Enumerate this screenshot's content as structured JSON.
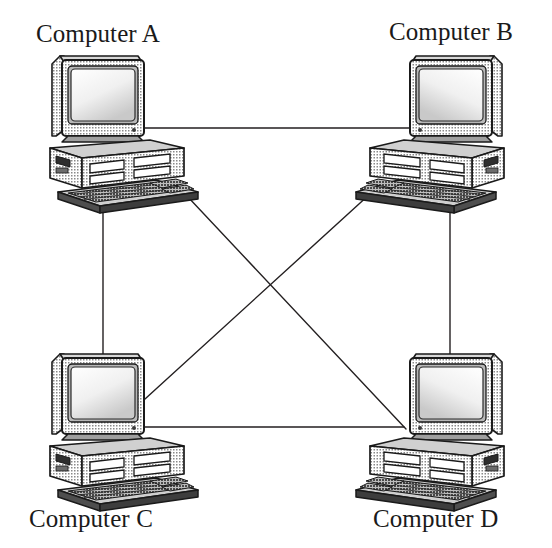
{
  "diagram": {
    "background_color": "#ffffff",
    "line_color": "#231f20",
    "line_width": 1.4,
    "width": 552,
    "height": 548
  },
  "nodes": [
    {
      "id": "A",
      "label": "Computer A",
      "icon": "desktop-computer-icon",
      "label_x": 36,
      "label_y": 20,
      "mirrored": false,
      "cx": 115,
      "cy": 130
    },
    {
      "id": "B",
      "label": "Computer B",
      "icon": "desktop-computer-icon",
      "label_x": 389,
      "label_y": 18,
      "mirrored": true,
      "cx": 440,
      "cy": 130
    },
    {
      "id": "C",
      "label": "Computer C",
      "icon": "desktop-computer-icon",
      "label_x": 29,
      "label_y": 505,
      "mirrored": false,
      "cx": 115,
      "cy": 428
    },
    {
      "id": "D",
      "label": "Computer D",
      "icon": "desktop-computer-icon",
      "label_x": 373,
      "label_y": 505,
      "mirrored": true,
      "cx": 440,
      "cy": 428
    }
  ],
  "links": [
    {
      "id": "link-a-b",
      "from": "A",
      "to": "B",
      "kind": "horizontal-top",
      "x1": 144,
      "y1": 128,
      "x2": 410,
      "y2": 128
    },
    {
      "id": "link-c-d",
      "from": "C",
      "to": "D",
      "kind": "horizontal-bottom",
      "x1": 141,
      "y1": 427,
      "x2": 404,
      "y2": 427
    },
    {
      "id": "link-a-c",
      "from": "A",
      "to": "C",
      "kind": "vertical-left",
      "x1": 103,
      "y1": 192,
      "x2": 103,
      "y2": 358
    },
    {
      "id": "link-b-d",
      "from": "B",
      "to": "D",
      "kind": "vertical-right",
      "x1": 450,
      "y1": 197,
      "x2": 450,
      "y2": 356
    },
    {
      "id": "link-a-d",
      "from": "A",
      "to": "D",
      "kind": "diagonal-down-right",
      "x1": 172,
      "y1": 180,
      "x2": 406,
      "y2": 429
    },
    {
      "id": "link-b-c",
      "from": "B",
      "to": "C",
      "kind": "diagonal-down-left",
      "x1": 382,
      "y1": 183,
      "x2": 145,
      "y2": 399
    }
  ],
  "crossing_point": {
    "x": 276,
    "y": 277
  },
  "topology": {
    "type": "full-mesh",
    "node_count": 4,
    "link_count": 6
  }
}
